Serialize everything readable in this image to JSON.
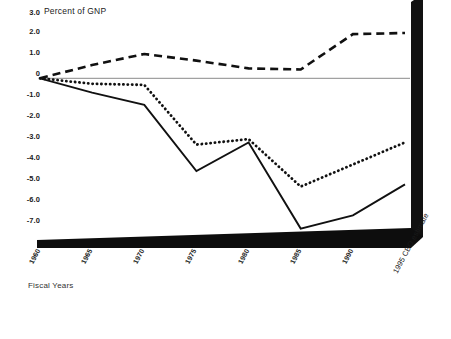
{
  "chart_data": {
    "type": "line",
    "title": "Percent of GNP",
    "xlabel": "Fiscal Years",
    "ylabel": "",
    "grid": false,
    "legend": "none",
    "ylim": [
      -7.0,
      3.0
    ],
    "ytick_labels": [
      "3.0",
      "2.0",
      "1.0",
      "0",
      "-1.0",
      "-2.0",
      "-3.0",
      "-4.0",
      "-5.0",
      "-6.0",
      "-7.0"
    ],
    "ytick_values": [
      3.0,
      2.0,
      1.0,
      0,
      -1.0,
      -2.0,
      -3.0,
      -4.0,
      -5.0,
      -6.0,
      -7.0
    ],
    "categories": [
      "1960",
      "1965",
      "1970",
      "1975",
      "1980",
      "1985",
      "1990",
      "1995 CBO estimate"
    ],
    "x": [
      1960,
      1965,
      1970,
      1975,
      1980,
      1985,
      1990,
      1995
    ],
    "series": [
      {
        "name": "dashed-series",
        "style": "dashed",
        "values": [
          0.0,
          0.6,
          1.1,
          0.8,
          0.45,
          0.4,
          2.0,
          2.05
        ]
      },
      {
        "name": "dotted-series",
        "style": "dotted",
        "values": [
          0.0,
          -0.25,
          -0.3,
          -3.0,
          -2.75,
          -4.9,
          -3.9,
          -2.9
        ]
      },
      {
        "name": "solid-series",
        "style": "solid",
        "values": [
          0.0,
          -0.65,
          -1.2,
          -4.2,
          -2.9,
          -6.8,
          -6.2,
          -4.8
        ]
      }
    ],
    "baseline_value": 0
  }
}
